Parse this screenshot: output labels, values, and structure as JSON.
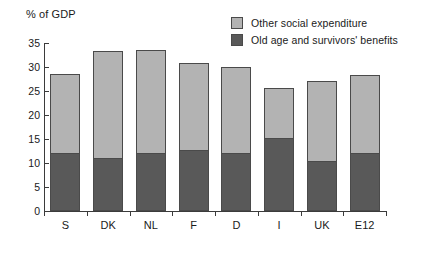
{
  "chart_data": {
    "type": "bar",
    "stacked": true,
    "title": "",
    "xlabel": "",
    "ylabel": "% of GDP",
    "ylim": [
      0,
      35
    ],
    "yticks": [
      0,
      5,
      10,
      15,
      20,
      25,
      30,
      35
    ],
    "grid": false,
    "legend_position": "top-right",
    "categories": [
      "S",
      "DK",
      "NL",
      "F",
      "D",
      "I",
      "UK",
      "E12"
    ],
    "series": [
      {
        "name": "Old age and survivors' benefits",
        "color": "#595959",
        "values": [
          12.0,
          11.1,
          12.0,
          12.7,
          12.0,
          15.2,
          10.4,
          12.0
        ]
      },
      {
        "name": "Other social expenditure",
        "color": "#b3b3b3",
        "values": [
          16.5,
          22.2,
          21.6,
          18.1,
          18.1,
          10.4,
          16.7,
          16.3
        ]
      }
    ],
    "totals": [
      28.5,
      33.3,
      33.6,
      30.8,
      30.1,
      25.6,
      27.1,
      28.3
    ]
  },
  "legend": {
    "items": [
      {
        "label": "Other social expenditure",
        "swatch": "light"
      },
      {
        "label": "Old age and survivors' benefits",
        "swatch": "dark"
      }
    ]
  }
}
